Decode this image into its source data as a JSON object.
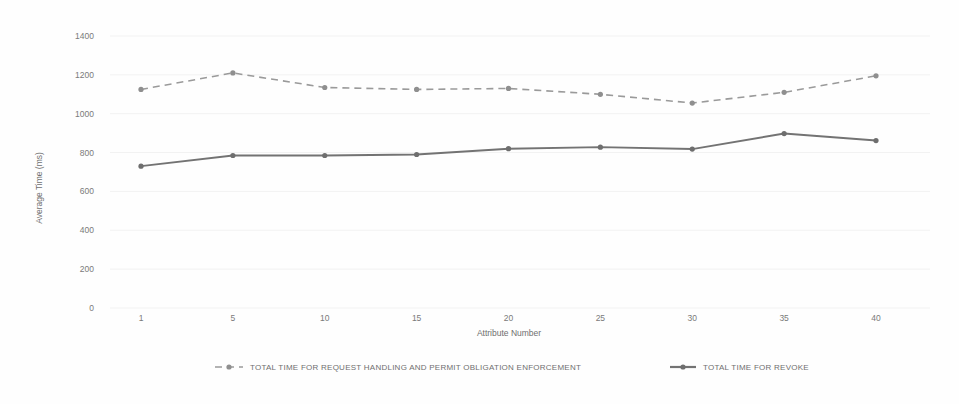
{
  "chart_data": {
    "type": "line",
    "title": "",
    "xlabel": "Attribute Number",
    "ylabel": "Average Time (ms)",
    "x": [
      1,
      5,
      10,
      15,
      20,
      25,
      30,
      35,
      40
    ],
    "xtick_labels": [
      "1",
      "5",
      "10",
      "15",
      "20",
      "25",
      "30",
      "35",
      "40"
    ],
    "ytick_labels": [
      "1400",
      "1200",
      "1000",
      "800",
      "600",
      "400",
      "200",
      "0"
    ],
    "ytick_values": [
      1400,
      1200,
      1000,
      800,
      600,
      400,
      200,
      0
    ],
    "ylim": [
      0,
      1400
    ],
    "xlim": [
      1,
      40
    ],
    "grid": "horizontal",
    "legend_position": "bottom",
    "series": [
      {
        "name": "TOTAL TIME FOR REQUEST HANDLING AND PERMIT OBLIGATION ENFORCEMENT",
        "style": "dashed",
        "color": "#9a9a9a",
        "values": [
          1125,
          1210,
          1135,
          1125,
          1130,
          1100,
          1055,
          1110,
          1195
        ]
      },
      {
        "name": "TOTAL TIME FOR REVOKE",
        "style": "solid",
        "color": "#737373",
        "values": [
          730,
          785,
          785,
          790,
          820,
          828,
          818,
          898,
          862
        ]
      }
    ]
  },
  "legend": {
    "items": [
      {
        "label": "TOTAL TIME FOR REQUEST HANDLING AND PERMIT OBLIGATION ENFORCEMENT",
        "style": "dashed"
      },
      {
        "label": "TOTAL TIME FOR REVOKE",
        "style": "solid"
      }
    ]
  }
}
